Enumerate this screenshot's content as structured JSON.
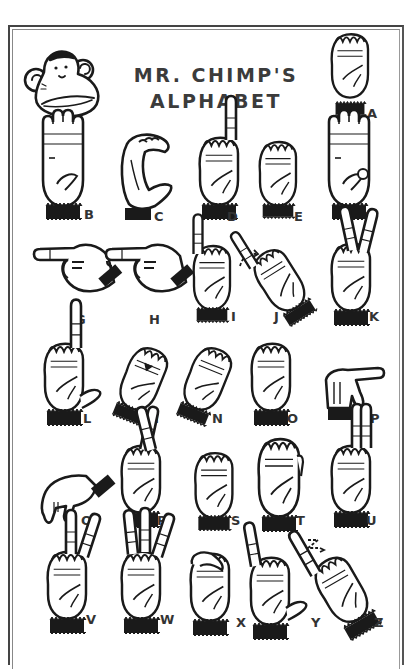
{
  "poster": {
    "title_line1": "MR. CHIMP'S",
    "title_line2": "ALPHABET",
    "mascot": "chimp-face-icon",
    "colors": {
      "ink": "#1a1a1a",
      "title": "#3b3b3b",
      "background": "#ffffff",
      "frame": "#444444"
    }
  },
  "letters": [
    {
      "letter": "A",
      "sign": "fist-thumb-side"
    },
    {
      "letter": "B",
      "sign": "flat-hand-thumb-folded"
    },
    {
      "letter": "C",
      "sign": "curved-c-shape"
    },
    {
      "letter": "D",
      "sign": "index-up-circle"
    },
    {
      "letter": "E",
      "sign": "fingers-curled-over-thumb"
    },
    {
      "letter": "F",
      "sign": "three-fingers-up-ok"
    },
    {
      "letter": "G",
      "sign": "index-pointing-sideways"
    },
    {
      "letter": "H",
      "sign": "two-fingers-sideways"
    },
    {
      "letter": "I",
      "sign": "pinky-up"
    },
    {
      "letter": "J",
      "sign": "pinky-up-arc-motion"
    },
    {
      "letter": "K",
      "sign": "two-fingers-v-thumb-between"
    },
    {
      "letter": "L",
      "sign": "l-shape"
    },
    {
      "letter": "M",
      "sign": "three-fingers-over-thumb"
    },
    {
      "letter": "N",
      "sign": "two-fingers-over-thumb"
    },
    {
      "letter": "O",
      "sign": "o-shape"
    },
    {
      "letter": "P",
      "sign": "k-pointing-down"
    },
    {
      "letter": "Q",
      "sign": "g-pointing-down"
    },
    {
      "letter": "R",
      "sign": "crossed-fingers"
    },
    {
      "letter": "S",
      "sign": "fist-thumb-across"
    },
    {
      "letter": "T",
      "sign": "thumb-between-fingers"
    },
    {
      "letter": "U",
      "sign": "two-fingers-together-up"
    },
    {
      "letter": "V",
      "sign": "two-fingers-v"
    },
    {
      "letter": "W",
      "sign": "three-fingers-up"
    },
    {
      "letter": "X",
      "sign": "hooked-index"
    },
    {
      "letter": "Y",
      "sign": "thumb-and-pinky-out"
    },
    {
      "letter": "Z",
      "sign": "index-z-motion"
    }
  ]
}
